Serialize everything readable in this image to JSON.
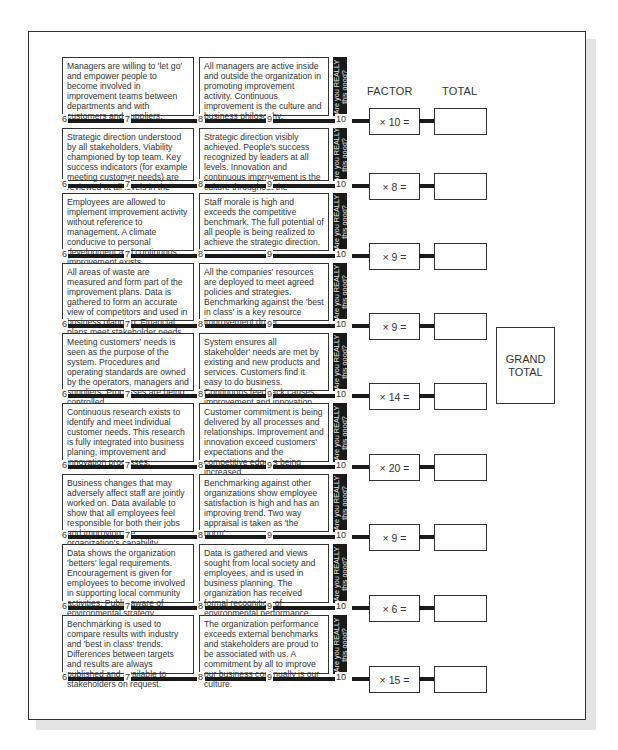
{
  "headers": {
    "factor": "FACTOR",
    "total": "TOTAL"
  },
  "strip_label_line1": "Are you REALLY",
  "strip_label_line2": "this good?",
  "scale_labels": [
    "6",
    "7",
    "8",
    "9",
    "10"
  ],
  "grand_total": {
    "line1": "GRAND",
    "line2": "TOTAL"
  },
  "rows": [
    {
      "left": "Managers are willing to 'let go' and empower people to become involved in improvement teams between departments and with customers and suppliers.",
      "right": "All managers are active inside and outside the organization in promoting improvement activity. Continuous improvement is the culture and business philosophy.",
      "factor": "× 10 =",
      "total": ""
    },
    {
      "left": "Strategic direction understood by all stakeholders. Viability championed by top team. Key success indicators (for example meeting customer needs) are reviewed at all levels in the organization.",
      "right": "Strategic direction visibly achieved. People's success recognized by leaders at all levels. Innovation and continuous improvement is the culture throughout the organization.",
      "factor": "× 8 =",
      "total": ""
    },
    {
      "left": "Employees are allowed to implement improvement activity without reference to management. A climate conducive to personal development and continuous improvement exists.",
      "right": "Staff morale is high and exceeds the competitive benchmark. The full potential of all people is being realized to achieve the strategic direction.",
      "factor": "× 9 =",
      "total": ""
    },
    {
      "left": "All areas of waste are measured and form part of the improvement plans. Data is gathered to form an accurate view of competitors and used in business planning. Financial plans meet stakeholder needs.",
      "right": "All the companies' resources are deployed to meet agreed policies and strategies. Benchmarking against the 'best in class' is a key resource improvement driver.",
      "factor": "× 9 =",
      "total": ""
    },
    {
      "left": "Meeting customers' needs is seen as the purpose of the system. Procedures and operating standards are owned by the operators, managers and suppliers. Processes are being controlled.",
      "right": "System ensures all stakeholder' needs are met by existing and new products and services. Customers find it easy to do business. Continuous feedback causes improvement and innovation.",
      "factor": "× 14 =",
      "total": ""
    },
    {
      "left": "Continuous research exists to identify and meet individual customer needs. This research is fully integrated into business planing, improvement and innovation processes.",
      "right": "Customer commitment is being delivered by all processes and relationships. Improvement and innovation exceed customers' expectations and the competitive edge is being increased.",
      "factor": "× 20 =",
      "total": ""
    },
    {
      "left": "Business changes that may adversely affect staff are jointly worked on. Data available to show that all employees feel responsible for both their jobs and improving the organization's capability.",
      "right": "Benchmarking against other organizations show employee satisfaction is high and has an improving trend. Two way appraisal is taken as 'the norm'.",
      "factor": "× 9 =",
      "total": ""
    },
    {
      "left": "Data shows the organization 'betters' legal requirements. Encouragement is given for employees to become involved in supporting local community activities. Public aware of environmental strategy.",
      "right": "Data is gathered and views sought from local society and employees, and is used in business planning. The organization has received formal recognition of environmental performance.",
      "factor": "× 6 =",
      "total": ""
    },
    {
      "left": "Benchmarking is used to compare results with industry and 'best in class' trends. Differences between targets and results are always published and available to stakeholders on request.",
      "right": "The organization performance exceeds external benchmarks and stakeholders are proud to be associated with us. A commitment by all to improve our business continually is our culture.",
      "factor": "× 15 =",
      "total": ""
    }
  ]
}
